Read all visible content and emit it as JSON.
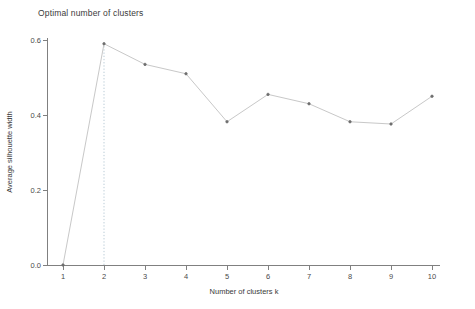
{
  "chart_data": {
    "type": "line",
    "title": "Optimal number of clusters",
    "xlabel": "Number of clusters k",
    "ylabel": "Average silhouette width",
    "x": [
      1,
      2,
      3,
      4,
      5,
      6,
      7,
      8,
      9,
      10
    ],
    "categories": [
      "1",
      "2",
      "3",
      "4",
      "5",
      "6",
      "7",
      "8",
      "9",
      "10"
    ],
    "values": [
      0.0,
      0.59,
      0.535,
      0.51,
      0.382,
      0.455,
      0.43,
      0.382,
      0.376,
      0.45
    ],
    "series": [
      {
        "name": "Average silhouette width",
        "values": [
          0.0,
          0.59,
          0.535,
          0.51,
          0.382,
          0.455,
          0.43,
          0.382,
          0.376,
          0.45
        ]
      }
    ],
    "xlim": [
      1,
      10
    ],
    "ylim": [
      0.0,
      0.6
    ],
    "xticks": [
      "1",
      "2",
      "3",
      "4",
      "5",
      "6",
      "7",
      "8",
      "9",
      "10"
    ],
    "yticks": [
      "0.0",
      "0.2",
      "0.4",
      "0.6"
    ],
    "ytick_values": [
      0.0,
      0.2,
      0.4,
      0.6
    ],
    "grid": false,
    "legend": "none",
    "annotations": [
      {
        "type": "vertical-dotted-line",
        "name": "optimal-k-reference-line",
        "x": 2,
        "label": "2"
      }
    ],
    "colors": {
      "line": "#c8c8c8",
      "marker": "#6e6e6e",
      "reference_line": "#b9cbd6",
      "axis": "#808080",
      "text": "#3a3a3a",
      "background": "#ffffff"
    }
  }
}
